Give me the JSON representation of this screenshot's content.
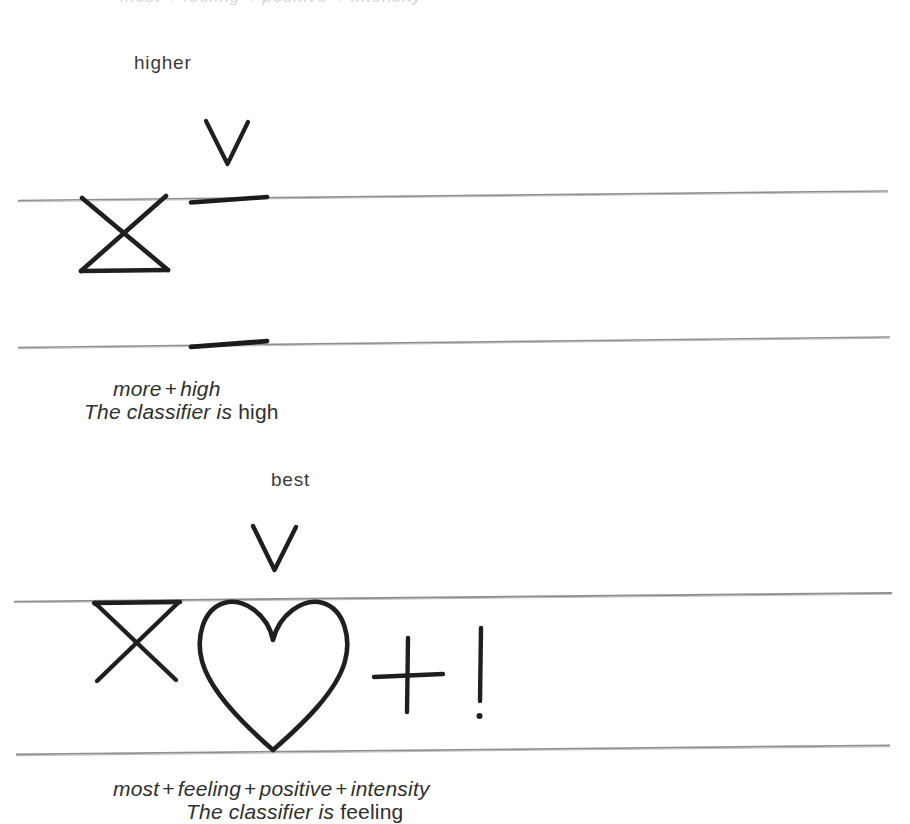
{
  "page": {
    "background_color": "#ffffff",
    "ink_color": "#1a1a1a",
    "rule_color": "#8a8a8a",
    "width": 910,
    "height": 824,
    "clipped_top_text": "most + feeling + positive + intensity"
  },
  "blocks": [
    {
      "id": "block-higher",
      "pointer_label": "higher",
      "pointer_icon": "v-arrow-icon",
      "marks": [
        "bowtie-x-icon",
        "thick-underline-mark"
      ],
      "caption_formula": {
        "terms": [
          "more",
          "high"
        ],
        "separator": "+",
        "text": "more + high"
      },
      "caption_sentence": {
        "prefix": "The classifier is",
        "value": "high",
        "text": "The classifier is high"
      }
    },
    {
      "id": "block-best",
      "pointer_label": "best",
      "pointer_icon": "v-arrow-icon",
      "marks": [
        "bowtie-x-icon",
        "heart-icon",
        "plus-icon",
        "exclamation-icon"
      ],
      "caption_formula": {
        "terms": [
          "most",
          "feeling",
          "positive",
          "intensity"
        ],
        "separator": "+",
        "text": "most + feeling + positive + intensity"
      },
      "caption_sentence": {
        "prefix": "The classifier is",
        "value": "feeling",
        "text": "The classifier is feeling"
      }
    }
  ],
  "rules": [
    {
      "id": "rule-1",
      "left_y": 199,
      "right_y": 190
    },
    {
      "id": "rule-2",
      "left_y": 346,
      "right_y": 336
    },
    {
      "id": "rule-3",
      "left_y": 600,
      "right_y": 592
    },
    {
      "id": "rule-4",
      "left_y": 753,
      "right_y": 744
    }
  ]
}
